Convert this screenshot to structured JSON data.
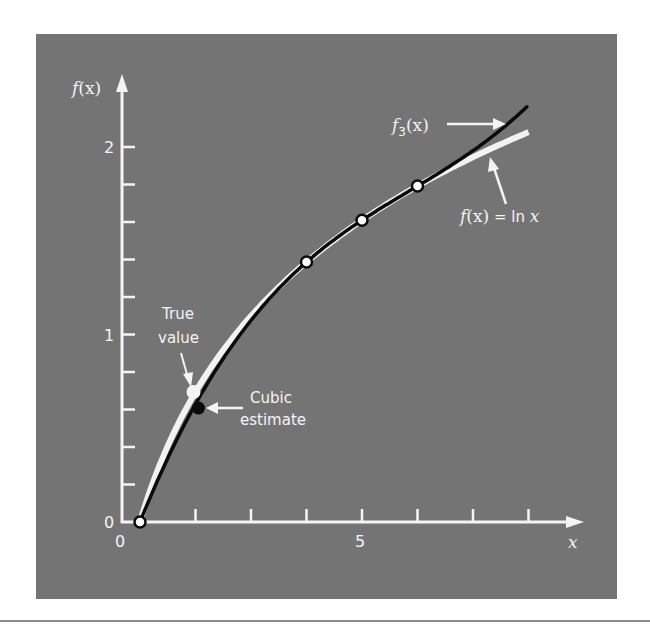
{
  "chart_data": {
    "type": "line",
    "title": "",
    "xlabel": "x",
    "ylabel": "f(x)",
    "xlim": [
      0,
      9
    ],
    "ylim": [
      0,
      2.2
    ],
    "x_ticks": [
      1,
      2,
      3,
      4,
      5,
      6,
      7,
      8
    ],
    "x_tick_labels": [
      {
        "value": 0,
        "label": "0"
      },
      {
        "value": 5,
        "label": "5"
      }
    ],
    "y_ticks": [
      0.2,
      0.4,
      0.6,
      0.8,
      1.0,
      1.2,
      1.4,
      1.6,
      1.8,
      2.0
    ],
    "y_tick_labels": [
      {
        "value": 0,
        "label": "0"
      },
      {
        "value": 1,
        "label": "1"
      },
      {
        "value": 2,
        "label": "2"
      }
    ],
    "grid": false,
    "series": [
      {
        "name": "f(x) = ln x",
        "function": "ln(x)",
        "x_range": [
          1,
          8.0
        ],
        "color": "#f2f2f2",
        "role": "true function"
      },
      {
        "name": "f3(x)",
        "function": "cubic interpolating polynomial through (1,0),(4,1.386294),(6,1.791759),(5,1.609438)",
        "newton_coefficients": [
          0,
          0.4620981,
          -0.05187311,
          0.007865529
        ],
        "newton_nodes": [
          1,
          4,
          6
        ],
        "x_range": [
          1,
          7.97
        ],
        "color": "#0a0a0a",
        "role": "cubic interpolation"
      }
    ],
    "data_points": [
      {
        "x": 1,
        "y": 0,
        "style": "open"
      },
      {
        "x": 4,
        "y": 1.386294,
        "style": "open"
      },
      {
        "x": 5,
        "y": 1.609438,
        "style": "open"
      },
      {
        "x": 6,
        "y": 1.791759,
        "style": "open"
      }
    ],
    "annotations": [
      {
        "text": [
          "True",
          "value"
        ],
        "x": 2,
        "y": 0.693147,
        "marker": "white-filled"
      },
      {
        "text": [
          "Cubic",
          "estimate"
        ],
        "x": 2,
        "y": 0.6291797,
        "marker": "black-filled"
      },
      {
        "text": "f3(x)",
        "points_to": "f3 curve end"
      },
      {
        "text": "f(x) = ln x",
        "points_to": "ln curve end"
      }
    ]
  },
  "labels": {
    "y_axis_f": "f",
    "y_axis_x": "(x)",
    "x_axis": "x",
    "tick_0_y": "0",
    "tick_1_y": "1",
    "tick_2_y": "2",
    "tick_0_x": "0",
    "tick_5_x": "5",
    "true_value_line1": "True",
    "true_value_line2": "value",
    "cubic_line1": "Cubic",
    "cubic_line2": "estimate",
    "f3_f": "f",
    "f3_sub": "3",
    "f3_arg": "(x)",
    "ln_f": "f",
    "ln_arg": "(x)",
    "ln_eq": " = ln ",
    "ln_x": "x"
  },
  "colors": {
    "panel": "#747474",
    "axis": "#f4f4f4",
    "ln_curve": "#f2f2f2",
    "cubic_curve": "#0a0a0a"
  }
}
